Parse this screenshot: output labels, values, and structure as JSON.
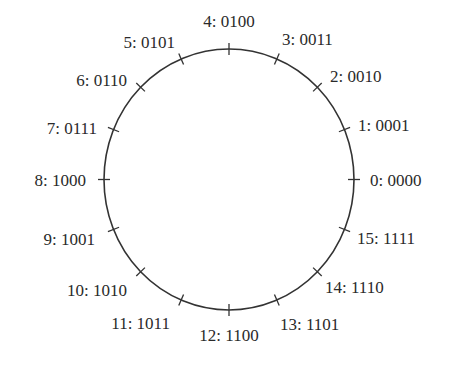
{
  "diagram": {
    "type": "circular-number-wheel",
    "center": {
      "x": 229,
      "y": 179.5
    },
    "radius": {
      "rx": 125,
      "ry": 130.5
    },
    "stroke_color": "#333333",
    "text_color": "#2a2a2a",
    "tick_half_length": 6,
    "nodes": [
      {
        "index": 0,
        "decimal": "0",
        "binary": "0000",
        "label": "0: 0000",
        "label_x": 370,
        "label_y": 186,
        "anchor": "start"
      },
      {
        "index": 1,
        "decimal": "1",
        "binary": "0001",
        "label": "1: 0001",
        "label_x": 358,
        "label_y": 131,
        "anchor": "start"
      },
      {
        "index": 2,
        "decimal": "2",
        "binary": "0010",
        "label": "2: 0010",
        "label_x": 330,
        "label_y": 82,
        "anchor": "start"
      },
      {
        "index": 3,
        "decimal": "3",
        "binary": "0011",
        "label": "3: 0011",
        "label_x": 282,
        "label_y": 45,
        "anchor": "start"
      },
      {
        "index": 4,
        "decimal": "4",
        "binary": "0100",
        "label": "4: 0100",
        "label_x": 229,
        "label_y": 27,
        "anchor": "middle"
      },
      {
        "index": 5,
        "decimal": "5",
        "binary": "0101",
        "label": "5: 0101",
        "label_x": 175,
        "label_y": 48,
        "anchor": "end"
      },
      {
        "index": 6,
        "decimal": "6",
        "binary": "0110",
        "label": "6: 0110",
        "label_x": 127,
        "label_y": 86,
        "anchor": "end"
      },
      {
        "index": 7,
        "decimal": "7",
        "binary": "0111",
        "label": "7: 0111",
        "label_x": 97,
        "label_y": 134,
        "anchor": "end"
      },
      {
        "index": 8,
        "decimal": "8",
        "binary": "1000",
        "label": "8: 1000",
        "label_x": 86,
        "label_y": 186,
        "anchor": "end"
      },
      {
        "index": 9,
        "decimal": "9",
        "binary": "1001",
        "label": "9: 1001",
        "label_x": 95,
        "label_y": 245,
        "anchor": "end"
      },
      {
        "index": 10,
        "decimal": "10",
        "binary": "1010",
        "label": "10: 1010",
        "label_x": 127,
        "label_y": 296,
        "anchor": "end"
      },
      {
        "index": 11,
        "decimal": "11",
        "binary": "1011",
        "label": "11: 1011",
        "label_x": 170,
        "label_y": 329,
        "anchor": "end"
      },
      {
        "index": 12,
        "decimal": "12",
        "binary": "1100",
        "label": "12: 1100",
        "label_x": 229,
        "label_y": 341,
        "anchor": "middle"
      },
      {
        "index": 13,
        "decimal": "13",
        "binary": "1101",
        "label": "13: 1101",
        "label_x": 280,
        "label_y": 330,
        "anchor": "start"
      },
      {
        "index": 14,
        "decimal": "14",
        "binary": "1110",
        "label": "14: 1110",
        "label_x": 325,
        "label_y": 293,
        "anchor": "start"
      },
      {
        "index": 15,
        "decimal": "15",
        "binary": "1111",
        "label": "15: 1111",
        "label_x": 357,
        "label_y": 244,
        "anchor": "start"
      }
    ]
  }
}
